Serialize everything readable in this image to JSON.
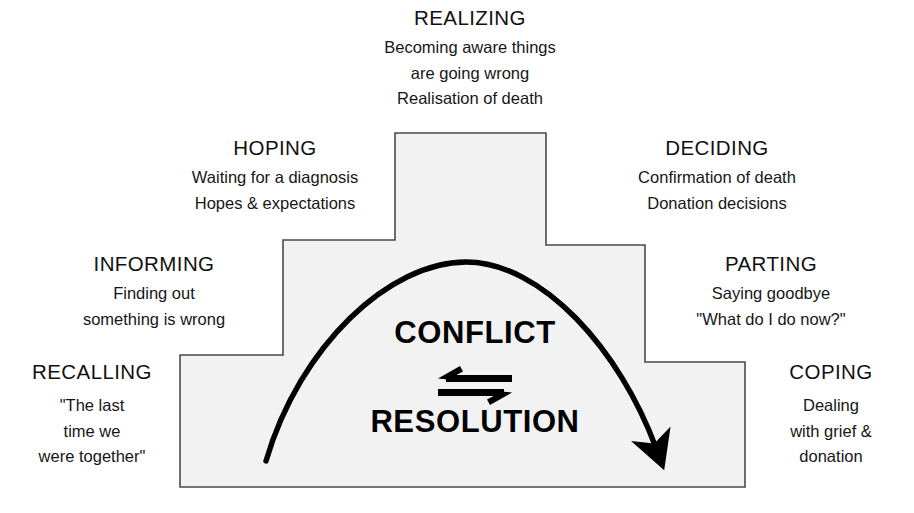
{
  "diagram": {
    "type": "staircase-process-diagram",
    "core": {
      "conflict_label": "CONFLICT",
      "resolution_label": "RESOLUTION",
      "equilibrium_arrow": "bidirectional-horizontal-arrows",
      "trajectory_arrow": "parabolic-arc-arrow"
    },
    "colors": {
      "step_fill": "#f2f2f2",
      "step_border": "#4a4a4a",
      "text": "#111111",
      "arrow": "#000000",
      "background": "#ffffff"
    },
    "stages": [
      {
        "id": "realizing",
        "title": "REALIZING",
        "lines": [
          "Becoming aware things",
          "are going wrong",
          "Realisation of death"
        ],
        "align": "center"
      },
      {
        "id": "hoping",
        "title": "HOPING",
        "lines": [
          "Waiting for a diagnosis",
          "Hopes & expectations"
        ],
        "align": "center"
      },
      {
        "id": "deciding",
        "title": "DECIDING",
        "lines": [
          "Confirmation of death",
          "Donation decisions"
        ],
        "align": "center"
      },
      {
        "id": "informing",
        "title": "INFORMING",
        "lines": [
          "Finding out",
          "something is wrong"
        ],
        "align": "center"
      },
      {
        "id": "parting",
        "title": "PARTING",
        "lines": [
          "Saying goodbye",
          "\"What do I do now?\""
        ],
        "align": "center"
      },
      {
        "id": "recalling",
        "title": "RECALLING",
        "lines": [
          "\"The last",
          "time we",
          "were together\""
        ],
        "align": "center"
      },
      {
        "id": "coping",
        "title": "COPING",
        "lines": [
          "Dealing",
          "with grief &",
          "donation"
        ],
        "align": "center"
      }
    ]
  }
}
